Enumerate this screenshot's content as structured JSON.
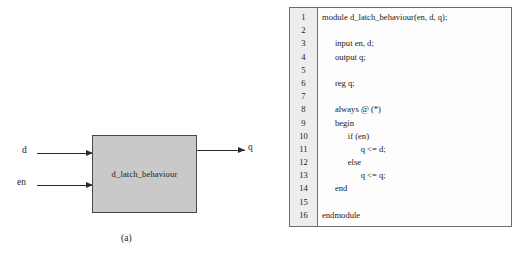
{
  "figure": {
    "panel_a": {
      "caption": "(a)",
      "block_label": "d_latch_behaviour",
      "block_fill_color": "#c9c9c9",
      "block_border_color": "#4a4a4a",
      "inputs": [
        {
          "label": "d"
        },
        {
          "label": "en"
        }
      ],
      "outputs": [
        {
          "label": "q"
        }
      ]
    },
    "panel_b": {
      "caption": "(b)",
      "gutter_color": "#ededed",
      "frame_border_color": "#6d6d6d",
      "code_lines": [
        {
          "number": "1",
          "text": "module d_latch_behaviour(en, d, q);"
        },
        {
          "number": "2",
          "text": ""
        },
        {
          "number": "3",
          "text": "      input en, d;"
        },
        {
          "number": "4",
          "text": "      output q;"
        },
        {
          "number": "5",
          "text": ""
        },
        {
          "number": "6",
          "text": "      reg q;"
        },
        {
          "number": "7",
          "text": ""
        },
        {
          "number": "8",
          "text": "      always @ (*)"
        },
        {
          "number": "9",
          "text": "      begin"
        },
        {
          "number": "10",
          "text": "            if (en)"
        },
        {
          "number": "11",
          "text": "                  q <= d;"
        },
        {
          "number": "12",
          "text": "            else"
        },
        {
          "number": "13",
          "text": "                  q <= q;"
        },
        {
          "number": "14",
          "text": "      end"
        },
        {
          "number": "15",
          "text": ""
        },
        {
          "number": "16",
          "text": "endmodule"
        }
      ]
    }
  }
}
